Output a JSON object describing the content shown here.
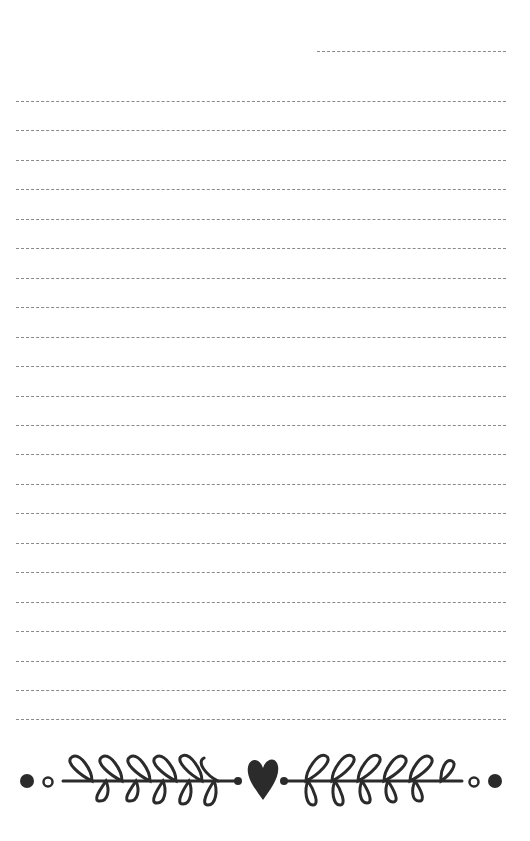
{
  "page": {
    "type": "lined notepaper",
    "background": "#ffffff",
    "line_color": "#8a8a8a",
    "ink_color": "#2b2b2b"
  },
  "header_line": {
    "x_start": 317,
    "x_end": 506,
    "y": 51
  },
  "lines": {
    "count": 22,
    "first_y": 101,
    "spacing": 29.45,
    "x_start": 16,
    "x_end": 506
  },
  "ornament": {
    "description": "laurel branches with heart centerpiece",
    "elements": [
      "dot",
      "ring",
      "left-branch",
      "heart",
      "right-branch",
      "ring",
      "dot"
    ],
    "center_y": 781
  }
}
